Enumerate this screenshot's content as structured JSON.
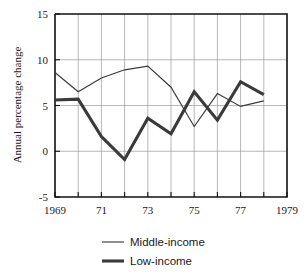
{
  "chart_data": {
    "type": "line",
    "title": "",
    "xlabel": "",
    "ylabel": "Annual percentage change",
    "x": [
      1969,
      1970,
      1971,
      1972,
      1973,
      1974,
      1975,
      1976,
      1977,
      1978
    ],
    "xlim": [
      1969,
      1979
    ],
    "ylim": [
      -5,
      15
    ],
    "yticks": [
      -5,
      0,
      5,
      10,
      15
    ],
    "ytick_labels": [
      "-5",
      "0",
      "5",
      "10",
      "15"
    ],
    "xticks": [
      1969,
      1970,
      1971,
      1972,
      1973,
      1974,
      1975,
      1976,
      1977,
      1978,
      1979
    ],
    "xtick_labels": [
      "1969",
      "",
      "71",
      "",
      "73",
      "",
      "75",
      "",
      "77",
      "",
      "1979"
    ],
    "grid": true,
    "legend_position": "bottom",
    "series": [
      {
        "name": "Middle-income",
        "line_style": "thin",
        "color": "#3a3a3a",
        "values": [
          8.6,
          6.5,
          8.0,
          8.9,
          9.3,
          7.0,
          2.7,
          6.3,
          4.9,
          5.5
        ]
      },
      {
        "name": "Low-income",
        "line_style": "thick",
        "color": "#3a3a3a",
        "values": [
          5.6,
          5.7,
          1.6,
          -0.9,
          3.6,
          1.9,
          6.5,
          3.4,
          7.6,
          6.2
        ]
      }
    ]
  },
  "axes": {
    "y_axis_title": "Annual percentage change"
  },
  "legend": {
    "items": [
      {
        "label": "Middle-income",
        "style": "thin"
      },
      {
        "label": "Low-income",
        "style": "thick"
      }
    ]
  }
}
